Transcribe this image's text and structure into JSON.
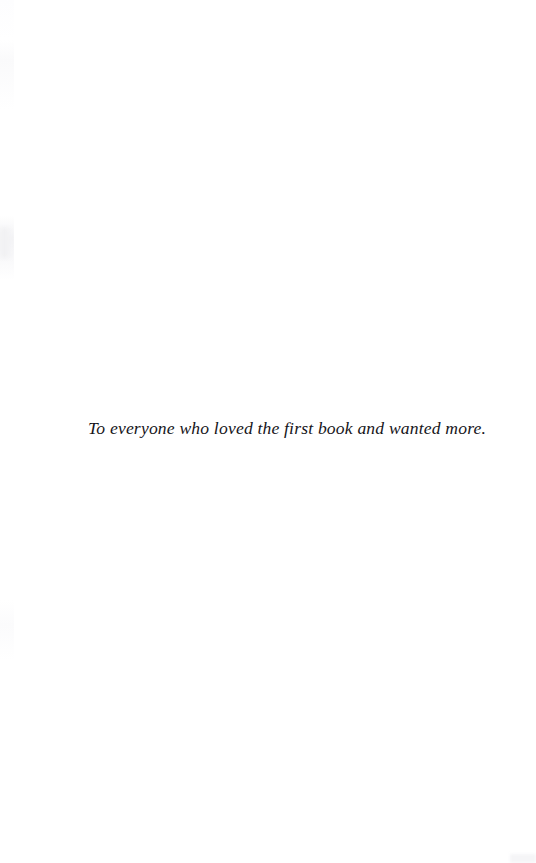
{
  "page": {
    "kind": "book-dedication-page",
    "width": 536,
    "height": 863,
    "background_color": "#ffffff",
    "ink_color": "#16151a"
  },
  "dedication": {
    "text": "To everyone who loved the first book and wanted more."
  },
  "artifacts": {
    "left_edge_band_color": "#fafafb",
    "left_smudge_color": "#f1f1f3",
    "corner_mark_color": "#f5f5f7"
  }
}
